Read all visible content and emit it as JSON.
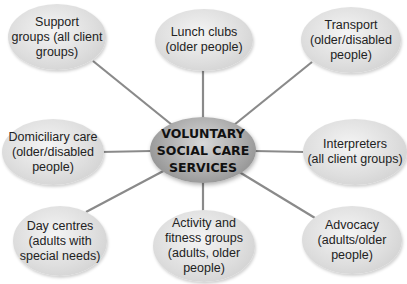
{
  "diagram": {
    "type": "spider-diagram",
    "center": {
      "label": "VOLUNTARY\nSOCIAL CARE\nSERVICES"
    },
    "nodes": [
      {
        "id": "support-groups",
        "label": "Support\ngroups (all client\ngroups)"
      },
      {
        "id": "lunch-clubs",
        "label": "Lunch clubs\n(older people)"
      },
      {
        "id": "transport",
        "label": "Transport\n(older/disabled\npeople)"
      },
      {
        "id": "domiciliary-care",
        "label": "Domiciliary care\n(older/disabled\npeople)"
      },
      {
        "id": "interpreters",
        "label": "Interpreters\n(all client groups)"
      },
      {
        "id": "day-centres",
        "label": "Day centres\n(adults with\nspecial needs)"
      },
      {
        "id": "activity-fitness",
        "label": "Activity and\nfitness groups\n(adults, older\npeople)"
      },
      {
        "id": "advocacy",
        "label": "Advocacy\n(adults/older\npeople)"
      }
    ],
    "colors": {
      "connector": "#8a8a8a",
      "node_fill": "#dedede",
      "center_fill": "#a9a9a9"
    }
  }
}
